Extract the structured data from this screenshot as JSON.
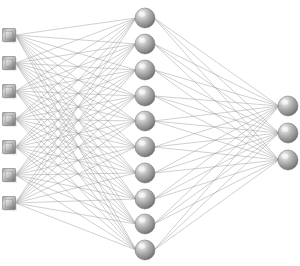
{
  "figure": {
    "background_color": "#ffffff",
    "width": 300,
    "height": 266
  },
  "style": {
    "edge_color": "#9a9a9a",
    "edge_width": 0.55,
    "edge_opacity": 0.85,
    "node_sphere_light": "#f2f2f2",
    "node_sphere_mid": "#a8a8a8",
    "node_sphere_dark": "#5e5e5e",
    "node_sphere_edge": "#6f6f6f",
    "node_square_light": "#e8e8e8",
    "node_square_mid": "#a6a6a6",
    "node_square_dark": "#6a6a6a",
    "node_square_edge": "#7a7a7a",
    "node_shadow": "#cfcfcf"
  },
  "chart_data": {
    "type": "diagram",
    "layers": [
      {
        "name": "input-layer",
        "node_shape": "square",
        "node_count": 7,
        "node_size": 13,
        "x": 9,
        "ys": [
          35,
          63,
          91,
          119,
          147,
          175,
          203
        ]
      },
      {
        "name": "hidden-layer",
        "node_shape": "sphere",
        "node_count": 10,
        "node_radius": 10,
        "x": 145,
        "ys": [
          18,
          44,
          70,
          96,
          121,
          147,
          173,
          199,
          224,
          250
        ]
      },
      {
        "name": "output-layer",
        "node_shape": "sphere",
        "node_count": 3,
        "node_radius": 10,
        "x": 288,
        "ys": [
          106,
          133,
          160
        ]
      }
    ],
    "connections": [
      {
        "from_layer": 0,
        "to_layer": 1,
        "pattern": "fully-connected",
        "count": 70
      },
      {
        "from_layer": 1,
        "to_layer": 2,
        "pattern": "fully-connected",
        "count": 30
      }
    ],
    "total_nodes": 20,
    "total_edges": 100
  }
}
